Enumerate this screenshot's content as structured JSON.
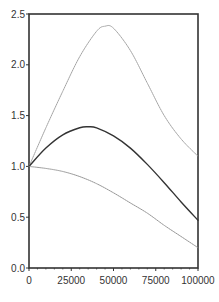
{
  "chart_data": {
    "type": "line",
    "title": "",
    "xlabel": "",
    "ylabel": "",
    "xlim": [
      0,
      100000
    ],
    "ylim": [
      0,
      2.5
    ],
    "grid": false,
    "legend": null,
    "x_ticks": [
      0,
      25000,
      50000,
      75000,
      100000
    ],
    "x_tick_labels": [
      "0",
      "25000",
      "50000",
      "75000",
      "100000"
    ],
    "y_ticks": [
      0,
      0.5,
      1.0,
      1.5,
      2.0,
      2.5
    ],
    "y_tick_labels": [
      "0.0",
      "0.5",
      "1.0",
      "1.5",
      "2.0",
      "2.5"
    ],
    "series": [
      {
        "name": "upper",
        "style": "dotted",
        "color": "#9a9a9a",
        "x": [
          0,
          10000,
          20000,
          30000,
          40000,
          45000,
          50000,
          60000,
          70000,
          80000,
          90000,
          100000
        ],
        "values": [
          1.0,
          1.38,
          1.74,
          2.08,
          2.33,
          2.38,
          2.36,
          2.14,
          1.82,
          1.5,
          1.27,
          1.1
        ]
      },
      {
        "name": "middle",
        "style": "solid",
        "color": "#333333",
        "x": [
          0,
          10000,
          20000,
          30000,
          35000,
          40000,
          50000,
          60000,
          70000,
          80000,
          90000,
          100000
        ],
        "values": [
          1.0,
          1.18,
          1.31,
          1.38,
          1.39,
          1.38,
          1.3,
          1.18,
          1.02,
          0.84,
          0.65,
          0.47
        ]
      },
      {
        "name": "lower",
        "style": "dotted",
        "color": "#8a8a8a",
        "x": [
          0,
          10000,
          20000,
          30000,
          40000,
          50000,
          60000,
          70000,
          80000,
          90000,
          100000
        ],
        "values": [
          1.0,
          0.98,
          0.95,
          0.9,
          0.83,
          0.74,
          0.64,
          0.54,
          0.42,
          0.31,
          0.2
        ]
      }
    ]
  },
  "colors": {
    "axis": "#333333",
    "background": "#ffffff"
  }
}
